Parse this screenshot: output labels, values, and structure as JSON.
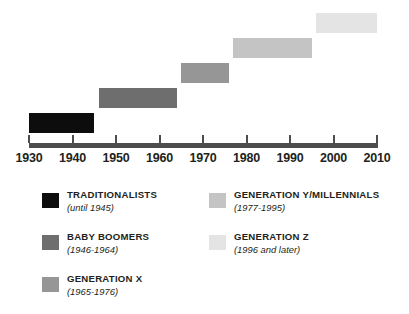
{
  "chart_data": {
    "type": "bar",
    "orientation": "horizontal",
    "title": "",
    "xlabel": "",
    "ylabel": "",
    "xlim": [
      1930,
      2010
    ],
    "grid": false,
    "legend_position": "bottom",
    "axis_ticks": [
      1930,
      1940,
      1950,
      1960,
      1970,
      1980,
      1990,
      2000,
      2010
    ],
    "series": [
      {
        "name": "TRADITIONALISTS",
        "range_label": "(until 1945)",
        "start": 1930,
        "end": 1945,
        "color": "#0d0d0d",
        "row": 0
      },
      {
        "name": "BABY BOOMERS",
        "range_label": "(1946-1964)",
        "start": 1946,
        "end": 1964,
        "color": "#6e6e6e",
        "row": 1
      },
      {
        "name": "GENERATION X",
        "range_label": "(1965-1976)",
        "start": 1965,
        "end": 1976,
        "color": "#969696",
        "row": 2
      },
      {
        "name": "GENERATION Y/MILLENNIALS",
        "range_label": "(1977-1995)",
        "start": 1977,
        "end": 1995,
        "color": "#c4c4c4",
        "row": 3
      },
      {
        "name": "GENERATION Z",
        "range_label": "(1996 and later)",
        "start": 1996,
        "end": 2010,
        "color": "#e4e4e4",
        "row": 4
      }
    ]
  },
  "axis": {
    "labels": [
      "1930",
      "1940",
      "1950",
      "1960",
      "1970",
      "1980",
      "1990",
      "2000",
      "2010"
    ],
    "line_color": "#4d4d4d"
  },
  "legend": {
    "left_column": [
      {
        "title": "TRADITIONALISTS",
        "years": "(until 1945)",
        "color": "#0d0d0d"
      },
      {
        "title": "BABY BOOMERS",
        "years": "(1946-1964)",
        "color": "#6e6e6e"
      },
      {
        "title": "GENERATION X",
        "years": "(1965-1976)",
        "color": "#969696"
      }
    ],
    "right_column": [
      {
        "title": "GENERATION Y/MILLENNIALS",
        "years": "(1977-1995)",
        "color": "#c4c4c4"
      },
      {
        "title": "GENERATION Z",
        "years": "(1996 and later)",
        "color": "#e4e4e4"
      }
    ]
  }
}
